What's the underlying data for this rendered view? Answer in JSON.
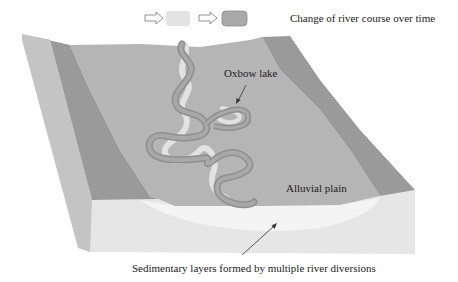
{
  "legend": {
    "arrow1_icon": "hollow-right-arrow",
    "swatch_old_color": "#e3e3e3",
    "arrow2_icon": "hollow-right-arrow",
    "swatch_new_color": "#a9a9a9",
    "text": "Change of river course over time"
  },
  "labels": {
    "oxbow_lake": "Oxbow lake",
    "alluvial_plain": "Alluvial plain",
    "sedimentary_layers": "Sedimentary layers formed by multiple river diversions"
  },
  "colors": {
    "plain": "#b5b5b5",
    "ridge": "#9a9a9a",
    "ridge_side": "#c4c4c4",
    "cross_section": "#e6e6e6",
    "sediment": "#f2f2f2",
    "river_outer": "#8f8f8f",
    "river_inner": "#a8a8a8",
    "old_channel": "#e2e2e2"
  }
}
